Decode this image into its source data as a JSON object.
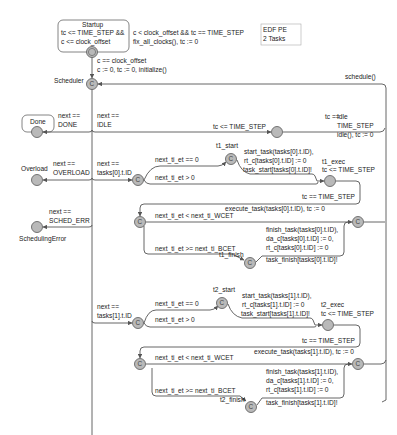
{
  "note": {
    "line1": "EDF PE",
    "line2": "2 Tasks"
  },
  "locations": {
    "startup": {
      "name": "Startup",
      "inv1": "tc <= TIME_STEP &&",
      "inv2": "c <= clock_offset"
    },
    "scheduler": {
      "name": "Scheduler",
      "committed": "C"
    },
    "done": {
      "name": "Done"
    },
    "overload": {
      "name": "Overload"
    },
    "sched_err": {
      "name": "SchedulingError"
    },
    "idle": {
      "name": "Idle"
    },
    "t1_branch": {
      "committed": "C"
    },
    "t1_start": {
      "name": "t1_start",
      "committed": "C"
    },
    "t1_exec": {
      "name": "t1_exec",
      "inv": "tc <= TIME_STEP"
    },
    "t1_check": {
      "committed": "C"
    },
    "t1_finish": {
      "name": "t1_finish",
      "committed": "C"
    },
    "t1_join": {
      "committed": "C"
    },
    "t2_branch": {
      "committed": "C"
    },
    "t2_start": {
      "name": "t2_start",
      "committed": "C"
    },
    "t2_exec": {
      "name": "t2_exec",
      "inv": "tc <= TIME_STEP"
    },
    "t2_check": {
      "committed": "C"
    },
    "t2_finish": {
      "name": "t2_finish",
      "committed": "C"
    },
    "t2_join": {
      "committed": "C"
    }
  },
  "edges": {
    "startup_self": {
      "guard": "c < clock_offset && tc == TIME_STEP",
      "update": "fix_all_clocks(), tc := 0"
    },
    "startup_to_sched": {
      "guard": "c == clock_offset",
      "update": "c := 0, tc := 0, initialize()"
    },
    "schedule_back": {
      "update": "schedule()"
    },
    "to_done": {
      "g1": "next ==",
      "g2": "DONE"
    },
    "to_idle_guard": {
      "g1": "next ==",
      "g2": "IDLE"
    },
    "idle_inv": "tc <= TIME_STEP",
    "idle_out": {
      "g1": "tc ==",
      "g2": "TIME_STEP",
      "update": "idle(), tc := 0"
    },
    "to_overload": {
      "g1": "next ==",
      "g2": "OVERLOAD"
    },
    "to_t1": {
      "g1": "next ==",
      "g2": "tasks[0].t.ID"
    },
    "to_sched_err": {
      "g1": "next ==",
      "g2": "SCHED_ERR"
    },
    "t1_et_zero": "next_ti_et == 0",
    "t1_et_pos": "next_ti_et > 0",
    "t1_start_upd": {
      "l1": "start_task(tasks[0].t.ID),",
      "l2": "rt_c[tasks[0].t.ID] := 0",
      "sync": "task_start[tasks[0].t.ID]!"
    },
    "t1_exec_guard": "tc == TIME_STEP",
    "t1_exec_upd": "execute_task(tasks[0].t.ID), tc := 0",
    "t1_lt_wcet": "next_ti_et < next_ti_WCET",
    "t1_ge_bcet": "next_ti_et >= next_ti_BCET",
    "t1_finish_upd": {
      "l1": "finish_task(tasks[0].t.ID),",
      "l2": "da_c[tasks[0].t.ID] := 0,",
      "l3": "rt_c[tasks[0].t.ID] := 0",
      "sync": "task_finish[tasks[0].t.ID]!"
    },
    "to_t2": {
      "g1": "next ==",
      "g2": "tasks[1].t.ID"
    },
    "t2_et_zero": "next_ti_et == 0",
    "t2_et_pos": "next_ti_et > 0",
    "t2_start_upd": {
      "l1": "start_task(tasks[1].t.ID),",
      "l2": "rt_c[tasks[1].t.ID] := 0",
      "sync": "task_start[tasks[1].t.ID]!"
    },
    "t2_exec_guard": "tc == TIME_STEP",
    "t2_exec_upd": "execute_task(tasks[1].t.ID), tc := 0",
    "t2_lt_wcet": "next_ti_et < next_ti_WCET",
    "t2_ge_bcet": "next_ti_et >= next_ti_BCET",
    "t2_finish_upd": {
      "l1": "finish_task(tasks[1].t.ID),",
      "l2": "da_c[tasks[1].t.ID] := 0,",
      "l3": "rt_c[tasks[1].t.ID] := 0",
      "sync": "task_finish[tasks[1].t.ID]!"
    }
  }
}
